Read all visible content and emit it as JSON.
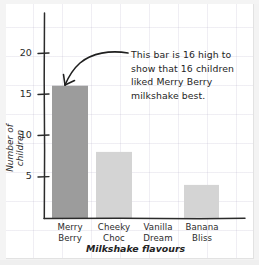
{
  "chart_data": {
    "type": "bar",
    "title": "",
    "xlabel": "Milkshake flavours",
    "ylabel": "Number of children",
    "categories": [
      "Merry Berry",
      "Cheeky Choc",
      "Vanilla Dream",
      "Banana Bliss"
    ],
    "category_lines": [
      [
        "Merry",
        "Berry"
      ],
      [
        "Cheeky",
        "Choc"
      ],
      [
        "Vanilla",
        "Dream"
      ],
      [
        "Banana",
        "Bliss"
      ]
    ],
    "values": [
      16,
      8,
      0,
      4
    ],
    "ylim": [
      0,
      23
    ],
    "yticks": [
      5,
      10,
      15,
      20
    ],
    "ytick_labels": [
      "5",
      "10",
      "15",
      "20"
    ],
    "grid": true,
    "legend": false,
    "bar_colors": [
      "#9c9c9c",
      "#d4d4d4",
      "#d4d4d4",
      "#d4d4d4"
    ],
    "annotations": [
      {
        "name": "bar-callout",
        "text": "This bar is 16 high to show that 16 children liked Merry Berry milkshake best.",
        "lines": [
          "This bar is 16 high to",
          "show that 16 children",
          "liked Merry Berry",
          "milkshake best."
        ],
        "points_to": "Merry Berry",
        "arrow": true
      }
    ]
  },
  "style": {
    "axis_color": "#2b2b2b",
    "grid_color": "#a096b9",
    "paper_color": "#ffffff",
    "text_color": "#2b2b2b",
    "bar_dark": "#9c9c9c",
    "bar_light": "#d4d4d4"
  }
}
